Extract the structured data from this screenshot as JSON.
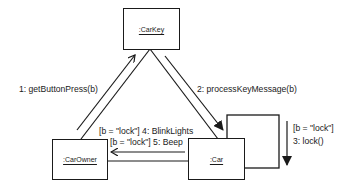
{
  "diagram": {
    "type": "UML communication diagram",
    "objects": {
      "carkey": {
        "name": ":CarKey"
      },
      "carowner": {
        "name": ":CarOwner"
      },
      "car": {
        "name": ":Car"
      }
    },
    "messages": {
      "m1": "1: getButtonPress(b)",
      "m2": "2: processKeyMessage(b)",
      "m3_guard": "[b = \"lock\"]",
      "m3": "3: lock()",
      "m4": "[b = \"lock\"] 4: BlinkLights",
      "m5": "[b = \"lock\"] 5: Beep"
    },
    "links": [
      {
        "from": ":CarOwner",
        "to": ":CarKey"
      },
      {
        "from": ":CarKey",
        "to": ":Car"
      },
      {
        "from": ":Car",
        "to": ":CarOwner"
      },
      {
        "from": ":Car",
        "to": ":Car",
        "kind": "self-link"
      }
    ]
  }
}
